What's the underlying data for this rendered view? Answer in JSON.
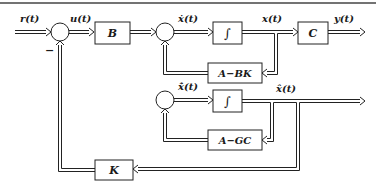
{
  "diagram": {
    "colors": {
      "stroke": "#222222",
      "background": "#ffffff"
    },
    "signals": {
      "r": "r(t)",
      "u": "u(t)",
      "xdot": "ẋ(t)",
      "x": "x(t)",
      "y": "y(t)",
      "xhatdot": "x̂̇(t)",
      "xhat": "x̂(t)",
      "minus": "−"
    },
    "blocks": {
      "B": "B",
      "integrator1": "∫",
      "C": "C",
      "A_BK": "A−BK",
      "integrator2": "∫",
      "A_GC": "A−GC",
      "K": "K"
    },
    "summing_junctions": [
      "sum-1",
      "sum-2",
      "sum-3"
    ]
  }
}
